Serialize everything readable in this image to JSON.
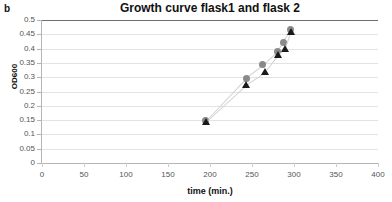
{
  "panel": {
    "label": "b"
  },
  "chart_data": {
    "type": "scatter",
    "title": "Growth curve flask1 and flask 2",
    "xlabel": "time (min.)",
    "ylabel": "OD600",
    "xlim": [
      0,
      400
    ],
    "ylim": [
      0,
      0.5
    ],
    "xticks": [
      0,
      50,
      100,
      150,
      200,
      250,
      300,
      350,
      400
    ],
    "yticks": [
      0,
      0.05,
      0.1,
      0.15,
      0.2,
      0.25,
      0.3,
      0.35,
      0.4,
      0.45,
      0.5
    ],
    "xtick_labels": [
      "0",
      "50",
      "100",
      "150",
      "200",
      "250",
      "300",
      "350",
      "400"
    ],
    "ytick_labels": [
      "0",
      "0.05",
      "0.1",
      "0.15",
      "0.2",
      "0.25",
      "0.3",
      "0.35",
      "0.4",
      "0.45",
      "0.5"
    ],
    "grid": "horizontal",
    "legend": "none",
    "series": [
      {
        "name": "flask 1",
        "marker": "circle",
        "color": "#8a8a8a",
        "x": [
          195,
          243,
          263,
          280,
          287,
          296
        ],
        "values": [
          0.148,
          0.297,
          0.343,
          0.389,
          0.423,
          0.467
        ]
      },
      {
        "name": "flask 2",
        "marker": "triangle",
        "color": "#1a1a1a",
        "x": [
          195,
          243,
          265,
          281,
          289,
          296
        ],
        "values": [
          0.145,
          0.274,
          0.317,
          0.377,
          0.398,
          0.458
        ]
      }
    ]
  }
}
